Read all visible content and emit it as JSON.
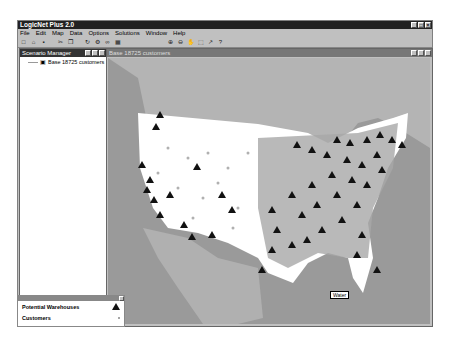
{
  "app": {
    "title": "LogicNet Plus 2.0",
    "menu": [
      "File",
      "Edit",
      "Map",
      "Data",
      "Options",
      "Solutions",
      "Window",
      "Help"
    ],
    "toolbar_icons": [
      "new-icon",
      "open-icon",
      "save-icon",
      "cut-icon",
      "copy-icon",
      "refresh-icon",
      "solve-icon",
      "link-icon",
      "grid-icon",
      "zoom-in-icon",
      "zoom-out-icon",
      "pan-icon",
      "select-icon",
      "arrow-icon",
      "help-icon"
    ],
    "toolbar_glyphs": [
      "□",
      "⌂",
      "▪",
      "✂",
      "❐",
      "↻",
      "⚙",
      "∞",
      "▦",
      "⊕",
      "⊖",
      "✋",
      "⬚",
      "↗",
      "?"
    ]
  },
  "scenario_manager": {
    "title": "Scenario Manager",
    "tree_item": "Base 18725 customers"
  },
  "map_window": {
    "title": "Base 18725 customers",
    "label": "Water"
  },
  "legend": {
    "rows": [
      {
        "label": "Potential Warehouses",
        "symbol": "triangle"
      },
      {
        "label": "Customers",
        "symbol": "dot"
      }
    ]
  },
  "colors": {
    "land_us": "#ffffff",
    "land_other": "#b0b0b0",
    "water": "#9a9a9a",
    "warehouse": "#111111",
    "customer": "#a0a0a0"
  }
}
